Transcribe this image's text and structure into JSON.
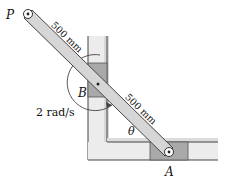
{
  "figure": {
    "points": {
      "P": "P",
      "B": "B",
      "A": "A"
    },
    "angle_label": "θ",
    "angular_velocity_label": "2 rad/s",
    "dimensions": {
      "PB": "500 mm",
      "BA": "500 mm"
    },
    "colors": {
      "bar_fill": "#d6d6d6",
      "block_fill": "#a9a9a9",
      "guide_shade": "#e9e9e9",
      "line": "#333333"
    }
  }
}
